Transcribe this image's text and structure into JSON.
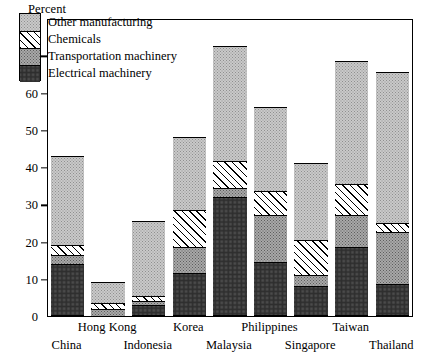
{
  "chart_data": {
    "type": "bar",
    "subtype": "stacked-bar",
    "title": "",
    "ylabel": "Percent",
    "xlabel": "",
    "ylim": [
      0,
      80
    ],
    "yticks": [
      0,
      10,
      20,
      30,
      40,
      50,
      60,
      70,
      80
    ],
    "grid": false,
    "legend_position": "upper-left-inside",
    "categories": [
      "China",
      "Hong Kong",
      "Indonesia",
      "Korea",
      "Malaysia",
      "Philippines",
      "Singapore",
      "Taiwan",
      "Thailand"
    ],
    "series": [
      {
        "name": "Electrical machinery",
        "pattern": "dark-stipple",
        "values": [
          14.0,
          0.0,
          3.0,
          11.5,
          32.0,
          14.5,
          8.0,
          18.5,
          8.5
        ]
      },
      {
        "name": "Transportation machinery",
        "pattern": "mid-stipple",
        "values": [
          2.5,
          2.0,
          1.0,
          7.0,
          2.5,
          12.5,
          3.0,
          8.5,
          14.0
        ]
      },
      {
        "name": "Chemicals",
        "pattern": "diagonal-hatch",
        "values": [
          2.5,
          1.5,
          1.5,
          10.0,
          7.0,
          6.5,
          9.5,
          8.5,
          2.5
        ]
      },
      {
        "name": "Other manufacturing",
        "pattern": "light-stipple",
        "values": [
          24.0,
          5.5,
          20.0,
          19.5,
          31.0,
          22.5,
          20.5,
          33.0,
          40.5
        ]
      }
    ],
    "totals": [
      43.0,
      9.0,
      25.5,
      48.0,
      72.5,
      56.0,
      41.0,
      68.5,
      65.5
    ],
    "cumulative_tops": [
      [
        14.0,
        16.5,
        19.0,
        43.0
      ],
      [
        0.0,
        2.0,
        3.5,
        9.0
      ],
      [
        3.0,
        4.0,
        5.5,
        25.5
      ],
      [
        11.5,
        18.5,
        28.5,
        48.0
      ],
      [
        32.0,
        34.5,
        41.5,
        72.5
      ],
      [
        14.5,
        27.0,
        33.5,
        56.0
      ],
      [
        8.0,
        11.0,
        20.5,
        41.0
      ],
      [
        18.5,
        27.0,
        35.5,
        68.5
      ],
      [
        8.5,
        22.5,
        25.0,
        65.5
      ]
    ]
  },
  "axis": {
    "y_title": "Percent",
    "y_tick_labels": [
      "80",
      "70",
      "60",
      "50",
      "40",
      "30",
      "20",
      "10",
      "0"
    ]
  },
  "legend": {
    "items": [
      {
        "label": "Other manufacturing"
      },
      {
        "label": "Chemicals"
      },
      {
        "label": "Transportation machinery"
      },
      {
        "label": "Electrical machinery"
      }
    ]
  },
  "x_axis": {
    "labels": [
      "China",
      "Hong Kong",
      "Indonesia",
      "Korea",
      "Malaysia",
      "Philippines",
      "Singapore",
      "Taiwan",
      "Thailand"
    ]
  }
}
